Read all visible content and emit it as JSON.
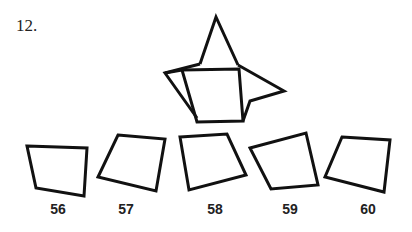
{
  "question": {
    "number": "12."
  },
  "figure": {
    "stroke_color": "#111111"
  },
  "options": [
    {
      "label": "56"
    },
    {
      "label": "57"
    },
    {
      "label": "58"
    },
    {
      "label": "59"
    },
    {
      "label": "60"
    }
  ]
}
